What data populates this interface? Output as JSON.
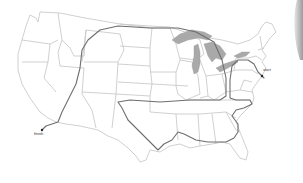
{
  "map": {
    "title": "US road trip route map",
    "region": "Contiguous United States",
    "markers": {
      "start": {
        "label": "start",
        "x": 262,
        "y": 75
      },
      "finish": {
        "label": "finish",
        "x": 41,
        "y": 131
      }
    },
    "colors": {
      "background": "#ffffff",
      "state_border": "#cfcfcf",
      "great_lakes": "#a9a9a9",
      "route": "#6e6e6e",
      "page_curl": "#9b9b9b"
    }
  }
}
